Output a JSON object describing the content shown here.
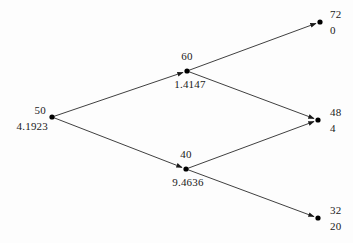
{
  "diagram": {
    "type": "binomial-lattice-tree",
    "stroke_color": "#2a2a2a",
    "node_color": "#000000",
    "background": "#fdfdfd",
    "nodes": [
      {
        "id": "root",
        "value": "50",
        "secondary": "4.1923",
        "x": 52,
        "y": 117,
        "value_pos": "above-left",
        "secondary_pos": "below-left"
      },
      {
        "id": "up",
        "value": "60",
        "secondary": "1.4147",
        "x": 187,
        "y": 71,
        "value_pos": "above",
        "secondary_pos": "below"
      },
      {
        "id": "down",
        "value": "40",
        "secondary": "9.4636",
        "x": 186,
        "y": 169,
        "value_pos": "above",
        "secondary_pos": "below"
      },
      {
        "id": "upup",
        "value": "72",
        "secondary": "0",
        "x": 320,
        "y": 22,
        "value_pos": "above-right",
        "secondary_pos": "below-right"
      },
      {
        "id": "updown",
        "value": "48",
        "secondary": "4",
        "x": 318,
        "y": 120,
        "value_pos": "above-right",
        "secondary_pos": "below-right"
      },
      {
        "id": "downdown",
        "value": "32",
        "secondary": "20",
        "x": 318,
        "y": 218,
        "value_pos": "above-right",
        "secondary_pos": "below-right"
      }
    ],
    "edges": [
      {
        "id": "root-up",
        "from": "root",
        "to": "up",
        "x1": 52,
        "y1": 117,
        "x2": 187,
        "y2": 71
      },
      {
        "id": "root-down",
        "from": "root",
        "to": "down",
        "x1": 52,
        "y1": 117,
        "x2": 186,
        "y2": 169
      },
      {
        "id": "up-upup",
        "from": "up",
        "to": "upup",
        "x1": 187,
        "y1": 71,
        "x2": 320,
        "y2": 22
      },
      {
        "id": "up-updown",
        "from": "up",
        "to": "updown",
        "x1": 187,
        "y1": 71,
        "x2": 318,
        "y2": 120
      },
      {
        "id": "down-updown",
        "from": "down",
        "to": "updown",
        "x1": 186,
        "y1": 169,
        "x2": 318,
        "y2": 120
      },
      {
        "id": "down-downdown",
        "from": "down",
        "to": "downdown",
        "x1": 186,
        "y1": 169,
        "x2": 318,
        "y2": 218
      }
    ],
    "labels": {
      "root_value": "50",
      "root_secondary": "4.1923",
      "up_value": "60",
      "up_secondary": "1.4147",
      "down_value": "40",
      "down_secondary": "9.4636",
      "upup_value": "72",
      "upup_secondary": "0",
      "updown_value": "48",
      "updown_secondary": "4",
      "downdown_value": "32",
      "downdown_secondary": "20"
    }
  }
}
